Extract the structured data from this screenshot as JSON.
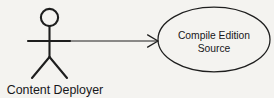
{
  "diagram": {
    "kind": "uml-use-case-diagram",
    "background_color": "#f4f3f0",
    "stroke_color": "#1e1e1e",
    "text_color": "#17171a",
    "actor": {
      "icon": "stick-figure-actor-icon",
      "label": "Content Deployer",
      "head_center_x": 49.5,
      "head_center_y": 17.5,
      "head_radius": 8.6,
      "body_top_y": 26.1,
      "body_bottom_y": 57,
      "arms_y": 41,
      "arms_left_x": 28,
      "arms_right_x": 70,
      "leg_left_x": 32,
      "leg_right_x": 67,
      "leg_bottom_y": 78,
      "label_center_x": 55,
      "label_baseline_y": 94
    },
    "association": {
      "name": "actor-to-usecase-association",
      "label": "",
      "arrow_style": "open-v-arrowhead",
      "start_x": 70,
      "end_x": 158,
      "y": 41,
      "arrow_tip_x": 158,
      "arrow_wing_back_x": 147.5,
      "arrow_wing_spread": 6.2
    },
    "use_case": {
      "name": "compile-edition-source",
      "shape": "ellipse",
      "center_x": 214,
      "center_y": 39.5,
      "radius_x": 56,
      "radius_y": 32.3,
      "lines": [
        "Compile Edition",
        "Source"
      ],
      "line1_baseline_y": 39,
      "line2_baseline_y": 51.5
    }
  }
}
